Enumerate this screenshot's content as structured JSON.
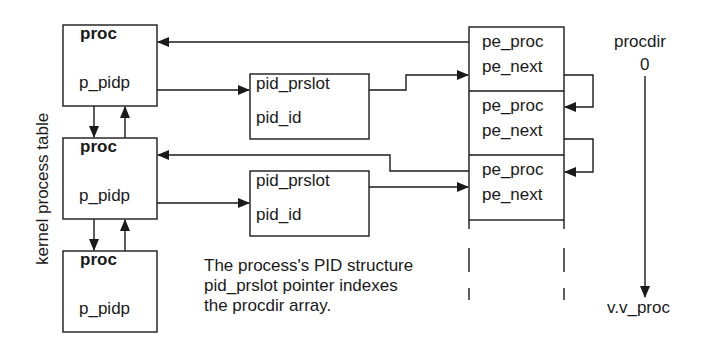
{
  "diagram": {
    "side_label": "kernel process table",
    "proc_boxes": [
      {
        "title": "proc",
        "field": "p_pidp"
      },
      {
        "title": "proc",
        "field": "p_pidp"
      },
      {
        "title": "proc",
        "field": "p_pidp"
      }
    ],
    "pid_boxes": [
      {
        "field1": "pid_prslot",
        "field2": "pid_id"
      },
      {
        "field1": "pid_prslot",
        "field2": "pid_id"
      }
    ],
    "procdir_cells": [
      {
        "field1": "pe_proc",
        "field2": "pe_next"
      },
      {
        "field1": "pe_proc",
        "field2": "pe_next"
      },
      {
        "field1": "pe_proc",
        "field2": "pe_next"
      }
    ],
    "procdir_axis": {
      "title": "procdir",
      "start": "0",
      "end": "v.v_proc"
    },
    "caption": [
      "The process's PID structure",
      "pid_prslot pointer indexes",
      "the procdir array."
    ],
    "colors": {
      "line": "#1a1a1a",
      "background": "#ffffff"
    }
  }
}
